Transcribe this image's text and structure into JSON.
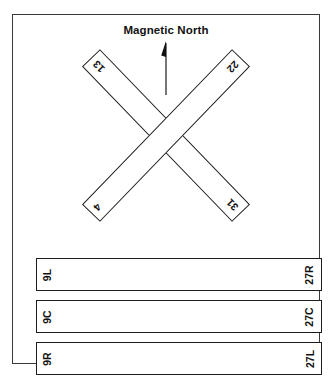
{
  "figure": {
    "type": "airport-runway-diagram",
    "north_reference": {
      "label": "Magnetic North",
      "icon": "north-arrow-icon"
    },
    "colors": {
      "frame_stroke": "#3a3a3a",
      "runway_stroke": "#1c1c1c",
      "runway_fill": "#ffffff",
      "text": "#111111",
      "background": "#ffffff"
    },
    "crossing_runways": [
      {
        "name": "runway-13-31",
        "start_label": "13",
        "end_label": "31",
        "orientation": "northwest-southeast"
      },
      {
        "name": "runway-4-22",
        "start_label": "4",
        "end_label": "22",
        "orientation": "southwest-northeast"
      }
    ],
    "parallel_runways": [
      {
        "name": "runway-9L-27R",
        "left_label": "9L",
        "right_label": "27R"
      },
      {
        "name": "runway-9C-27C",
        "left_label": "9C",
        "right_label": "27C"
      },
      {
        "name": "runway-9R-27L",
        "left_label": "9R",
        "right_label": "27L"
      }
    ]
  }
}
